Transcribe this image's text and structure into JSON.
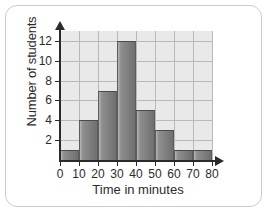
{
  "chart_data": {
    "type": "bar",
    "title": "",
    "xlabel": "Time in minutes",
    "ylabel": "Number of students",
    "categories": [
      "0-10",
      "10-20",
      "20-30",
      "30-40",
      "40-50",
      "50-60",
      "60-70",
      "70-80"
    ],
    "values": [
      1,
      4,
      7,
      12,
      5,
      3,
      1,
      1
    ],
    "bin_edges": [
      0,
      10,
      20,
      30,
      40,
      50,
      60,
      70,
      80
    ],
    "xlim": [
      0,
      80
    ],
    "ylim": [
      0,
      13
    ],
    "xticks": [
      "0",
      "10",
      "20",
      "30",
      "40",
      "50",
      "60",
      "70",
      "80"
    ],
    "yticks": [
      "2",
      "4",
      "6",
      "8",
      "10",
      "12"
    ],
    "ytick_values": [
      2,
      4,
      6,
      8,
      10,
      12
    ],
    "grid": true,
    "legend": false,
    "colors": {
      "bar_fill": "#808080",
      "bar_edge": "#4a4a4a",
      "plot_background": "#e9e9e9",
      "gridline": "#b9b9b9",
      "axis": "#2b2b2b",
      "text": "#2b2b2b",
      "card_border": "#c9ccce",
      "page_background": "#ffffff"
    }
  }
}
